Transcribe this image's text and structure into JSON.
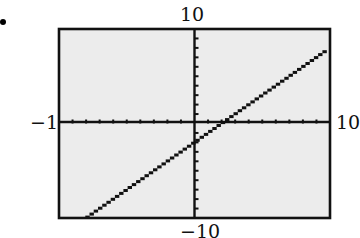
{
  "figure": {
    "bullet": "•",
    "labels": {
      "ymax": "10",
      "ymin": "−10",
      "xmin": "−10",
      "xmax": "10"
    },
    "colors": {
      "plot_background": "#ececec",
      "frame": "#111111",
      "axes": "#111111",
      "line": "#111111"
    }
  },
  "chart_data": {
    "type": "line",
    "title": "",
    "xlabel": "",
    "ylabel": "",
    "xlim": [
      -10,
      10
    ],
    "ylim": [
      -10,
      10
    ],
    "xscale": 1,
    "yscale": 1,
    "grid": false,
    "legend": null,
    "window_labels": {
      "xmin": "−10",
      "xmax": "10",
      "ymin": "−10",
      "ymax": "10"
    },
    "series": [
      {
        "name": "y = x − 2",
        "equation": "y = x - 2",
        "style": "dotted calculator pixels",
        "x": [
          -7.9,
          9.6
        ],
        "y": [
          -9.9,
          7.6
        ],
        "x_intercept": 2,
        "y_intercept": -2
      }
    ]
  }
}
